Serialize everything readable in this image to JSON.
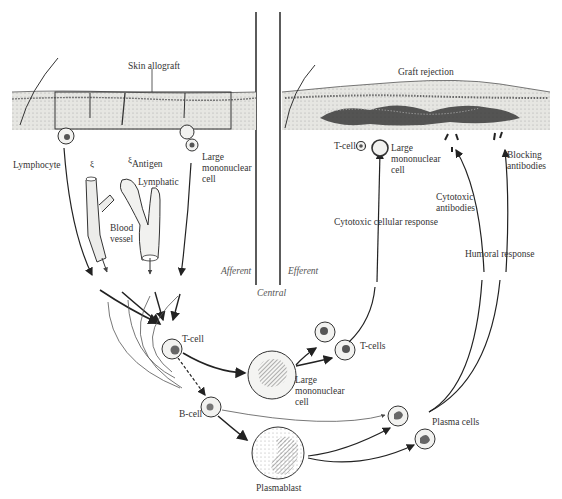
{
  "diagram": {
    "regions": {
      "afferent": "Afferent",
      "central": "Central",
      "efferent": "Efferent"
    },
    "afferent_labels": {
      "skin_allograft": "Skin allograft",
      "lymphocyte": "Lymphocyte",
      "antigen": "Antigen",
      "lymphatic": "Lymphatic",
      "large_mononuclear_cell": "Large mononuclear cell",
      "blood_vessel": "Blood vessel"
    },
    "efferent_labels": {
      "graft_rejection": "Graft rejection",
      "t_cell": "T-cell",
      "large_mononuclear_cell": "Large mononuclear cell",
      "blocking_antibodies": "Blocking antibodies",
      "cytotoxic_antibodies": "Cytotoxic antibodies",
      "cytotoxic_cellular_response": "Cytotoxic cellular response",
      "humoral_response": "Humoral response"
    },
    "central_labels": {
      "t_cell": "T-cell",
      "b_cell": "B-cell",
      "large_mononuclear_cell": "Large mononuclear cell",
      "t_cells": "T-cells",
      "plasmablast": "Plasmablast",
      "plasma_cells": "Plasma cells"
    },
    "colors": {
      "ink": "#2a2a2a",
      "skin_fill": "#e6e6e2",
      "infiltrate": "#3a3a3a",
      "cell_fill": "#f2f2f0"
    }
  }
}
